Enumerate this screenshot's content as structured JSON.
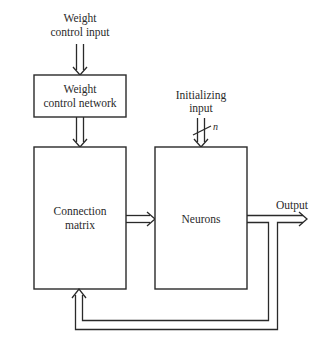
{
  "diagram": {
    "type": "block-diagram",
    "inputs": {
      "weight_control_input": {
        "line1": "Weight",
        "line2": "control input"
      },
      "initializing_input": {
        "line1": "Initializing",
        "line2": "input",
        "bus_width_label": "n"
      }
    },
    "blocks": [
      {
        "id": "weight-control-network",
        "line1": "Weight",
        "line2": "control network"
      },
      {
        "id": "connection-matrix",
        "line1": "Connection",
        "line2": "matrix"
      },
      {
        "id": "neurons",
        "line1": "Neurons"
      }
    ],
    "outputs": {
      "output_label": "Output"
    },
    "connections": [
      {
        "from": "weight_control_input",
        "to": "weight-control-network"
      },
      {
        "from": "weight-control-network",
        "to": "connection-matrix"
      },
      {
        "from": "initializing_input",
        "to": "neurons"
      },
      {
        "from": "connection-matrix",
        "to": "neurons"
      },
      {
        "from": "neurons",
        "to": "output"
      },
      {
        "from": "neurons",
        "to": "connection-matrix",
        "kind": "feedback"
      }
    ]
  }
}
